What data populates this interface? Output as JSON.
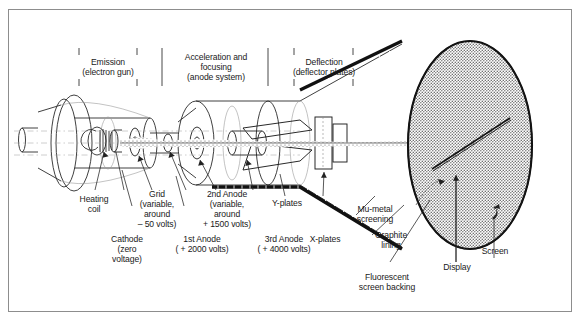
{
  "figure": {
    "frame_color": "#8d8d8d",
    "ink_color": "#1a1a1a",
    "screen_fill": "#bdbdbd"
  },
  "sections": [
    {
      "id": "emission",
      "label": "Emission\n(electron gun)"
    },
    {
      "id": "acceleration",
      "label": "Acceleration and\nfocusing\n(anode system)"
    },
    {
      "id": "deflection",
      "label": "Deflection\n(deflector plates)"
    }
  ],
  "callouts": {
    "heating_coil": "Heating\ncoil",
    "cathode": "Cathode\n(zero\nvoltage)",
    "grid": "Grid\n(variable,\naround\n– 50 volts)",
    "first_anode": "1st Anode\n( + 2000 volts)",
    "second_anode": "2nd Anode\n(variable,\naround\n+ 1500 volts)",
    "third_anode": "3rd Anode\n( + 4000 volts)",
    "y_plates": "Y-plates",
    "x_plates": "X-plates",
    "mu_metal": "Mu-metal\nscreening",
    "graphite_lining": "Graphite\nlining",
    "fluorescent_screen": "Fluorescent\nscreen backing",
    "display": "Display",
    "screen": "Screen"
  }
}
